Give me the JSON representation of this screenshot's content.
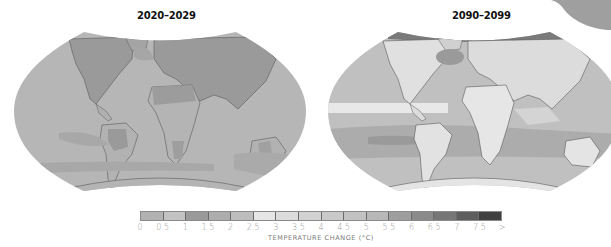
{
  "maps": [
    {
      "title": "2020–2029",
      "ocean_color": "#b4b4b4",
      "land_warm_color": "#999999",
      "description": "Projected surface temperature change, early century (mostly 0.5–2 °C)"
    },
    {
      "title": "2090–2099",
      "ocean_color": "#c2c2c2",
      "land_warm_color": "#e2e2e2",
      "description": "Projected surface temperature change, late century (mostly 2.5–5 °C, Arctic >6 °C)"
    }
  ],
  "legend": {
    "title": "TEMPERATURE CHANGE (°C)",
    "ticks": [
      "0",
      "0.5",
      "1",
      "1.5",
      "2",
      "2.5",
      "3",
      "3.5",
      "4",
      "4.5",
      "5",
      "5.5",
      "6",
      "6.5",
      "7",
      "7.5",
      ">"
    ],
    "colors": [
      "#b2b2b2",
      "#c3c3c3",
      "#9a9a9a",
      "#adadad",
      "#bdbdbd",
      "#e6e6e6",
      "#dcdcdc",
      "#d2d2d2",
      "#c9c9c9",
      "#c2c2c2",
      "#b8b8b8",
      "#9e9e9e",
      "#8a8a8a",
      "#767676",
      "#5e5e5e",
      "#404040"
    ]
  },
  "chart_data": {
    "type": "heatmap",
    "panels": [
      "2020–2029",
      "2090–2099"
    ],
    "legend_label": "TEMPERATURE CHANGE (°C)",
    "bins": [
      0,
      0.5,
      1,
      1.5,
      2,
      2.5,
      3,
      3.5,
      4,
      4.5,
      5,
      5.5,
      6,
      6.5,
      7,
      7.5,
      ">7.5"
    ],
    "legend_position": "bottom"
  }
}
